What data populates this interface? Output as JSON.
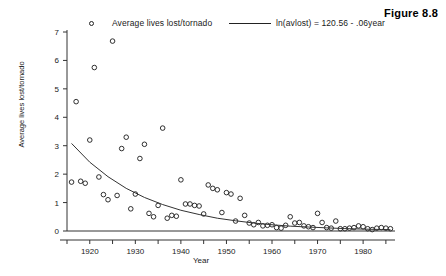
{
  "figure": {
    "caption": "Figure 8.8"
  },
  "legend": {
    "position": "top",
    "marker_icon": "open-circle-marker",
    "scatter_label": "Average lives lost/tornado",
    "line_icon": "line-sample",
    "fit_label": "ln(avlost) = 120.56 - .06year"
  },
  "chart_data": {
    "type": "scatter",
    "title": "",
    "subtitle": "",
    "xlabel": "Year",
    "ylabel": "Average lives lost/tornado",
    "xlim": [
      1915,
      1987
    ],
    "ylim": [
      -0.15,
      7.4
    ],
    "xticks": [
      1920,
      1930,
      1940,
      1950,
      1960,
      1970,
      1980
    ],
    "yticks": [
      0,
      1,
      2,
      3,
      4,
      5,
      6,
      7
    ],
    "xtick_labels": [
      "1920",
      "1930",
      "1940",
      "1950",
      "1960",
      "1970",
      "1980"
    ],
    "ytick_labels": [
      "0",
      "1",
      "2",
      "3",
      "4",
      "5",
      "6",
      "7"
    ],
    "grid": false,
    "legend_position": "top",
    "marker_style": "open circle",
    "series": [
      {
        "name": "Average lives lost/tornado",
        "type": "scatter",
        "x": [
          1916,
          1917,
          1918,
          1919,
          1920,
          1921,
          1922,
          1923,
          1924,
          1925,
          1926,
          1927,
          1928,
          1929,
          1930,
          1931,
          1932,
          1933,
          1934,
          1935,
          1936,
          1937,
          1938,
          1939,
          1940,
          1941,
          1942,
          1943,
          1944,
          1945,
          1946,
          1947,
          1948,
          1949,
          1950,
          1951,
          1952,
          1953,
          1954,
          1955,
          1956,
          1957,
          1958,
          1959,
          1960,
          1961,
          1962,
          1963,
          1964,
          1965,
          1966,
          1967,
          1968,
          1969,
          1970,
          1971,
          1972,
          1973,
          1974,
          1975,
          1976,
          1977,
          1978,
          1979,
          1980,
          1981,
          1982,
          1983,
          1984,
          1985,
          1986
        ],
        "y": [
          1.72,
          4.55,
          1.75,
          1.68,
          3.2,
          5.75,
          1.9,
          1.28,
          1.1,
          6.68,
          1.25,
          2.9,
          3.3,
          0.78,
          1.3,
          2.55,
          3.05,
          0.62,
          0.5,
          0.9,
          3.62,
          0.45,
          0.55,
          0.52,
          1.8,
          0.95,
          0.95,
          0.9,
          0.88,
          0.6,
          1.62,
          1.5,
          1.45,
          0.65,
          1.35,
          1.3,
          0.35,
          1.15,
          0.55,
          0.28,
          0.22,
          0.3,
          0.18,
          0.2,
          0.22,
          0.12,
          0.1,
          0.2,
          0.5,
          0.28,
          0.3,
          0.18,
          0.15,
          0.12,
          0.62,
          0.3,
          0.12,
          0.1,
          0.35,
          0.08,
          0.08,
          0.1,
          0.12,
          0.18,
          0.15,
          0.08,
          0.05,
          0.1,
          0.12,
          0.1,
          0.08
        ]
      },
      {
        "name": "ln(avlost) = 120.56 - .06year",
        "type": "line",
        "equation": "ln(avlost) = 120.56 - .06year",
        "intercept": 120.56,
        "slope": -0.06,
        "x": [
          1916,
          1920,
          1924,
          1928,
          1932,
          1936,
          1940,
          1944,
          1948,
          1952,
          1956,
          1960,
          1964,
          1968,
          1972,
          1976,
          1980,
          1984,
          1986
        ],
        "y": [
          3.08,
          2.42,
          1.91,
          1.5,
          1.18,
          0.93,
          0.73,
          0.58,
          0.45,
          0.36,
          0.28,
          0.22,
          0.17,
          0.14,
          0.11,
          0.085,
          0.067,
          0.053,
          0.047
        ]
      },
      {
        "name": "zero-baseline",
        "type": "line",
        "x": [
          1915,
          1987
        ],
        "y": [
          0,
          0
        ]
      }
    ]
  }
}
